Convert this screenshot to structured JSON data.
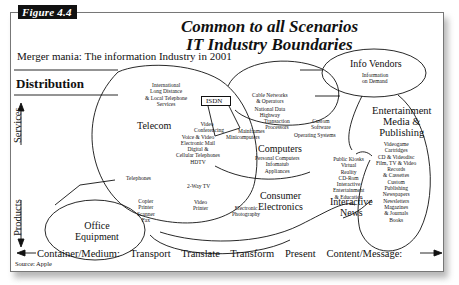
{
  "figure_tag": "Figure 4.4",
  "title_line1": "Common to all Scenarios",
  "title_line2": "IT Industry Boundaries",
  "subtitle": "Merger mania: The information Industry in 2001",
  "distribution_label": "Distribution",
  "vertical_axis": {
    "top_label": "Services",
    "bottom_label": "Products"
  },
  "horizontal_axis": {
    "start_label": "Container/Medium:",
    "steps": [
      "Transport",
      "Translate",
      "Transform",
      "Present"
    ],
    "end_label": "Content/Message:"
  },
  "source": "Source: Apple",
  "isdn": "ISDN",
  "regions": {
    "telecom": {
      "name": "Telecom",
      "items": [
        "International",
        "Long Distance",
        "& Local Telephone",
        "Services"
      ]
    },
    "cable": {
      "items": [
        "Cable Networks",
        "& Operators",
        "National Data",
        "Highway",
        "Transaction",
        "Processors"
      ]
    },
    "info_vendors": {
      "name": "Info Vendors",
      "items": [
        "Information",
        "on Demand"
      ]
    },
    "entertainment": {
      "name_lines": [
        "Entertainment",
        "Media &",
        "Publishing"
      ],
      "items": [
        "Videogame",
        "Cartridges",
        "CD & Videodisc",
        "Film, TV & Video",
        "Records",
        "& Cassettes",
        "Custom",
        "Publishing",
        "Newspapers",
        "Newsletters",
        "Magazines",
        "& Journals",
        "Books"
      ]
    },
    "computers": {
      "name": "Computers",
      "items_left": [
        "Mainframes",
        "Minicomputers"
      ],
      "items_right": [
        "Custom",
        "Software",
        "Operating Systems"
      ],
      "items_below": [
        "Personal Computers",
        "Infomatub",
        "Appliances"
      ]
    },
    "telecom_services": {
      "items": [
        "Video",
        "Conferencing",
        "Voice & Video",
        "Electronic Mail",
        "Digital &",
        "Cellular Telephones",
        "HDTV"
      ]
    },
    "interactive": {
      "items": [
        "Public Kiosks",
        "Virtual",
        "Reality",
        "CD-Rom",
        "Interactive",
        "Entertainment",
        "& Education"
      ],
      "name_lines": [
        "Interactive",
        "News"
      ]
    },
    "office": {
      "name_lines": [
        "Office",
        "Equipment"
      ],
      "items": [
        "Copier",
        "Printer",
        "Scanner",
        "Fax"
      ]
    },
    "consumer": {
      "name_lines": [
        "Consumer",
        "Electronics"
      ],
      "items": [
        "2-Way TV",
        "Video",
        "Printer",
        "Electronic",
        "Photography"
      ]
    },
    "telephones": "Telephones"
  }
}
